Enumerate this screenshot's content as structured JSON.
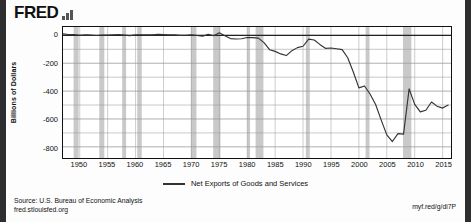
{
  "brand": {
    "name": "FRED",
    "mark_icon": "bar-chart-icon"
  },
  "axes": {
    "ylabel": "Billions of Dollars",
    "yticks": [
      0,
      -200,
      -400,
      -600,
      -800
    ],
    "ytick_labels": [
      "0",
      "-200",
      "-400",
      "-600",
      "-800"
    ],
    "xtick_labels": [
      "1950",
      "1955",
      "1960",
      "1965",
      "1970",
      "1975",
      "1980",
      "1985",
      "1990",
      "1995",
      "2000",
      "2005",
      "2010",
      "2015"
    ]
  },
  "legend": {
    "series_label": "Net Exports of Goods and Services"
  },
  "footer": {
    "source": "Source: U.S. Bureau of Economic Analysis",
    "site": "fred.stlouisfed.org",
    "short_url": "myf.red/g/di7P"
  },
  "colors": {
    "line": "#333333",
    "recession_band": "#c9c9c9",
    "grid": "#9a9a9a",
    "frame": "#111111"
  },
  "chart_data": {
    "type": "line",
    "title": "",
    "xlabel": "",
    "ylabel": "Billions of Dollars",
    "xlim": [
      1947,
      2016.5
    ],
    "ylim": [
      -880,
      60
    ],
    "grid": true,
    "legend_position": "bottom-center",
    "series": [
      {
        "name": "Net Exports of Goods and Services",
        "x": [
          1947,
          1948,
          1949,
          1950,
          1951,
          1952,
          1953,
          1954,
          1955,
          1956,
          1957,
          1958,
          1959,
          1960,
          1961,
          1962,
          1963,
          1964,
          1965,
          1966,
          1967,
          1968,
          1969,
          1970,
          1971,
          1972,
          1973,
          1974,
          1975,
          1976,
          1977,
          1978,
          1979,
          1980,
          1981,
          1982,
          1983,
          1984,
          1985,
          1986,
          1987,
          1988,
          1989,
          1990,
          1991,
          1992,
          1993,
          1994,
          1995,
          1996,
          1997,
          1998,
          1999,
          2000,
          2001,
          2002,
          2003,
          2004,
          2005,
          2006,
          2007,
          2008,
          2009,
          2010,
          2011,
          2012,
          2013,
          2014,
          2015,
          2016
        ],
        "values": [
          11,
          6,
          6,
          1,
          3,
          2,
          -1,
          2,
          2,
          4,
          6,
          2,
          -2,
          4,
          4,
          3,
          4,
          7,
          5,
          3,
          3,
          0,
          0,
          4,
          -1,
          -6,
          7,
          -3,
          18,
          -2,
          -23,
          -26,
          -24,
          -15,
          -16,
          -20,
          -52,
          -103,
          -115,
          -133,
          -145,
          -110,
          -88,
          -78,
          -27,
          -33,
          -65,
          -93,
          -91,
          -96,
          -102,
          -161,
          -263,
          -377,
          -363,
          -421,
          -496,
          -608,
          -714,
          -762,
          -705,
          -709,
          -384,
          -495,
          -549,
          -537,
          -478,
          -508,
          -522,
          -500
        ],
        "color": "#333333"
      }
    ],
    "recession_bands": [
      [
        1948.9,
        1949.8
      ],
      [
        1953.5,
        1954.4
      ],
      [
        1957.6,
        1958.3
      ],
      [
        1960.3,
        1961.1
      ],
      [
        1969.9,
        1970.9
      ],
      [
        1973.9,
        1975.2
      ],
      [
        1980.0,
        1980.5
      ],
      [
        1981.5,
        1982.9
      ],
      [
        1990.5,
        1991.2
      ],
      [
        2001.2,
        2001.9
      ],
      [
        2007.9,
        2009.4
      ]
    ]
  }
}
